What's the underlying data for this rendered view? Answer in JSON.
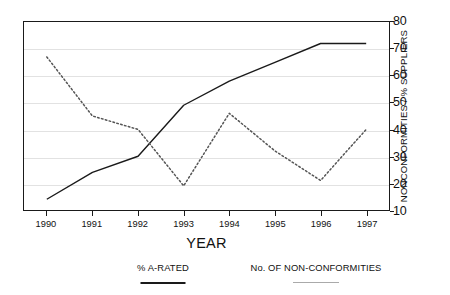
{
  "chart_data": {
    "type": "line",
    "title": "",
    "subtitle": "",
    "xlabel": "YEAR",
    "ylabel": "NONCONFORMITIES / % SUPPLIERS",
    "categories": [
      "1990",
      "1991",
      "1992",
      "1993",
      "1994",
      "1995",
      "1996",
      "1997"
    ],
    "x": [
      1990,
      1991,
      1992,
      1993,
      1994,
      1995,
      1996,
      1997
    ],
    "ylim": [
      10,
      80
    ],
    "yticks": [
      10,
      20,
      30,
      40,
      50,
      60,
      70,
      80
    ],
    "grid": "horizontal",
    "legend_position": "bottom",
    "series": [
      {
        "name": "% A-RATED",
        "style": "solid",
        "color": "#1a1a1a",
        "values": [
          14,
          24,
          30,
          49,
          58,
          65,
          72,
          72
        ]
      },
      {
        "name": "No. OF NON-CONFORMITIES",
        "style": "dotted",
        "color": "#555555",
        "values": [
          67,
          45,
          40,
          19,
          46,
          32,
          21,
          40
        ]
      }
    ]
  },
  "axes": {
    "y_title": "NONCONFORMITIES / % SUPPLIERS",
    "x_title": "YEAR",
    "y_tick_labels": [
      "80",
      "70",
      "60",
      "50",
      "40",
      "30",
      "20",
      "10"
    ],
    "x_tick_labels": [
      "1990",
      "1991",
      "1992",
      "1993",
      "1994",
      "1995",
      "1996",
      "1997"
    ]
  },
  "legend": {
    "entries": [
      {
        "label": "% A-RATED",
        "style": "solid"
      },
      {
        "label": "No. OF NON-CONFORMITIES",
        "style": "dotted"
      }
    ]
  }
}
